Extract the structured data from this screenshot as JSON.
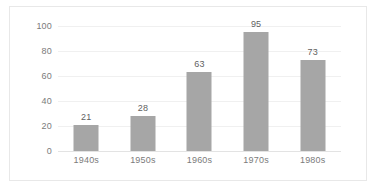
{
  "chart_data": {
    "type": "bar",
    "title": "",
    "subtitle": "",
    "xlabel": "",
    "ylabel": "",
    "categories": [
      "1940s",
      "1950s",
      "1960s",
      "1970s",
      "1980s"
    ],
    "values": [
      21,
      28,
      63,
      95,
      73
    ],
    "data_labels": [
      "21",
      "28",
      "63",
      "95",
      "73"
    ],
    "ylim": [
      0,
      100
    ],
    "y_ticks": [
      0,
      20,
      40,
      60,
      80,
      100
    ],
    "y_tick_labels": [
      "0",
      "20",
      "40",
      "60",
      "80",
      "100"
    ],
    "grid": true,
    "grid_orientation": "horizontal",
    "legend": false,
    "legend_position": "none",
    "bar_color": "#a6a6a6",
    "gridline_color": "#f0f0f0",
    "axis_color": "#e3e3e3",
    "border_color": "#e8e8e8",
    "label_color": "#7b7b7b",
    "value_label_color": "#5f5f5f",
    "background_color": "#ffffff"
  }
}
